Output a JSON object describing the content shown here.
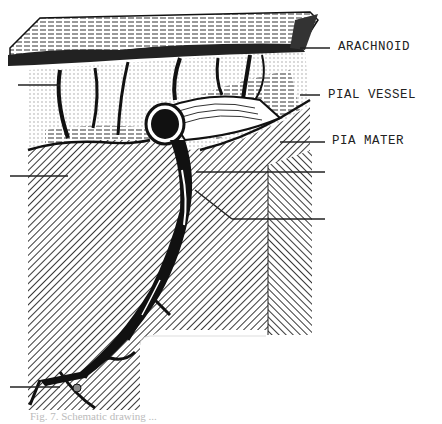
{
  "figure": {
    "type": "anatomical-illustration",
    "labels": [
      {
        "id": "arachnoid",
        "text": "ARACHNOID",
        "side": "right",
        "y": 48
      },
      {
        "id": "pial-vessel",
        "text": "PIAL VESSEL",
        "side": "right",
        "y": 96
      },
      {
        "id": "pia-mater",
        "text": "PIA MATER",
        "side": "right",
        "y": 142
      }
    ],
    "unlabeled_leaders": [
      {
        "side": "left",
        "y": 85
      },
      {
        "side": "left",
        "y": 176
      },
      {
        "side": "left",
        "y": 387
      },
      {
        "side": "right",
        "y": 172
      },
      {
        "side": "right",
        "y": 219
      }
    ],
    "caption": "Fig. 7. Schematic drawing ...",
    "colors": {
      "ink": "#111111",
      "paper": "#ffffff"
    }
  }
}
